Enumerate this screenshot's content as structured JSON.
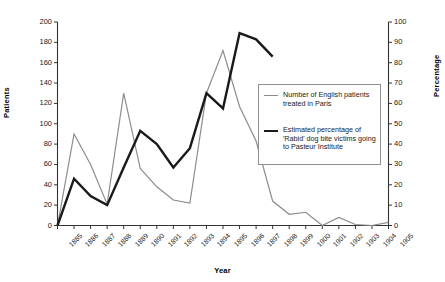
{
  "chart_data": {
    "type": "line",
    "title": "",
    "xlabel": "Year",
    "ylabel": "Patients",
    "ylabel_secondary": "Percentage",
    "grid": false,
    "legend_position": "right-center",
    "categories": [
      "1885",
      "1886",
      "1887",
      "1888",
      "1889",
      "1890",
      "1891",
      "1892",
      "1893",
      "1894",
      "1895",
      "1896",
      "1897",
      "1898",
      "1899",
      "1900",
      "1901",
      "1902",
      "1903",
      "1904",
      "1905"
    ],
    "ylim": [
      0,
      200
    ],
    "yticks": [
      0,
      20,
      40,
      60,
      80,
      100,
      120,
      140,
      160,
      180,
      200
    ],
    "ylim_secondary": [
      0,
      100
    ],
    "yticks_secondary": [
      0,
      10,
      20,
      30,
      40,
      50,
      60,
      70,
      80,
      90,
      100
    ],
    "series": [
      {
        "name": "Number of English patients treated in Paris",
        "axis": "left",
        "color": "#8c8c8c",
        "linewidth": 1.2,
        "x": [
          "1885",
          "1886",
          "1887",
          "1888",
          "1889",
          "1890",
          "1891",
          "1892",
          "1893",
          "1894",
          "1895",
          "1896",
          "1897",
          "1898",
          "1899",
          "1900",
          "1901",
          "1902",
          "1903",
          "1904",
          "1905"
        ],
        "values": [
          0,
          90,
          60,
          21,
          130,
          56,
          38,
          25,
          22,
          130,
          172,
          117,
          83,
          24,
          11,
          13,
          0,
          8,
          1,
          0,
          3
        ]
      },
      {
        "name": "Estimated percentage of 'Rabid' dog bite victims going to Pasteur Institute",
        "axis": "right",
        "color": "#1a1a1a",
        "linewidth": 2.4,
        "x": [
          "1885",
          "1886",
          "1887",
          "1888",
          "1889",
          "1890",
          "1891",
          "1892",
          "1893",
          "1894",
          "1895",
          "1896",
          "1897",
          "1898"
        ],
        "values": [
          0,
          23,
          14.5,
          10,
          28.5,
          46.5,
          40,
          28.5,
          38,
          65,
          57.5,
          94.5,
          91.5,
          83
        ]
      }
    ]
  },
  "axes": {
    "left": {
      "title": "Patients",
      "ticks": [
        "200",
        "180",
        "160",
        "140",
        "120",
        "100",
        "80",
        "60",
        "40",
        "20",
        "0"
      ]
    },
    "right": {
      "title": "Percentage",
      "ticks": [
        "100",
        "90",
        "80",
        "70",
        "60",
        "50",
        "40",
        "30",
        "20",
        "10",
        "0"
      ]
    },
    "bottom": {
      "title": "Year",
      "ticks": [
        "1885",
        "1886",
        "1887",
        "1888",
        "1889",
        "1890",
        "1891",
        "1892",
        "1893",
        "1894",
        "1895",
        "1896",
        "1897",
        "1898",
        "1899",
        "1900",
        "1901",
        "1902",
        "1903",
        "1904",
        "1905"
      ]
    }
  },
  "legend": {
    "entries": [
      {
        "label": "Number of English patients treated in Paris",
        "style": "thin"
      },
      {
        "label": "Estimated percentage of 'Rabid' dog bite victims going to Pasteur Institute",
        "style": "thick"
      }
    ]
  }
}
